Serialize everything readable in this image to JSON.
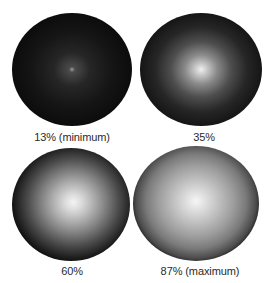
{
  "figure": {
    "panels": [
      {
        "label": "13% (minimum)",
        "value_percent": 13
      },
      {
        "label": "35%",
        "value_percent": 35
      },
      {
        "label": "60%",
        "value_percent": 60
      },
      {
        "label": "87% (maximum)",
        "value_percent": 87
      }
    ]
  }
}
